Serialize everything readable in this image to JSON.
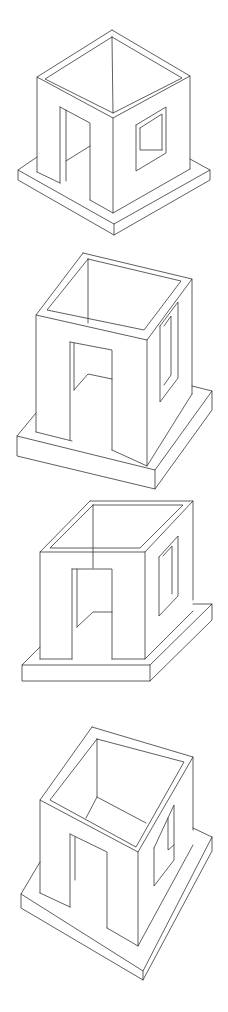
{
  "diagram": {
    "title": "",
    "stroke_color": "#2a2a2a",
    "background": "#ffffff",
    "figures": [
      {
        "id": "figure-1",
        "view": "isometric",
        "polylines": [
          [
            [
              112,
              30
            ],
            [
              190,
              76
            ],
            [
              113,
              118
            ],
            [
              37,
              77
            ],
            [
              112,
              30
            ]
          ],
          [
            [
              112,
              37
            ],
            [
              182,
              78
            ],
            [
              113,
              113
            ],
            [
              45,
              79
            ],
            [
              112,
              37
            ]
          ],
          [
            [
              112,
              37
            ],
            [
              113,
              113
            ]
          ],
          [
            [
              37,
              77
            ],
            [
              37,
              172
            ]
          ],
          [
            [
              113,
              118
            ],
            [
              113,
              213
            ]
          ],
          [
            [
              190,
              76
            ],
            [
              190,
              169
            ]
          ],
          [
            [
              37,
              157
            ],
            [
              18,
              170
            ],
            [
              114,
              224
            ],
            [
              210,
              170
            ],
            [
              190,
              159
            ]
          ],
          [
            [
              18,
              170
            ],
            [
              18,
              180
            ],
            [
              114,
              235
            ],
            [
              210,
              180
            ],
            [
              210,
              170
            ]
          ],
          [
            [
              114,
              224
            ],
            [
              114,
              235
            ]
          ],
          [
            [
              37,
              172
            ],
            [
              60,
              183
            ]
          ],
          [
            [
              90,
              200
            ],
            [
              113,
              213
            ],
            [
              190,
              169
            ]
          ],
          [
            [
              60,
              107
            ],
            [
              60,
              183
            ]
          ],
          [
            [
              66,
              110
            ],
            [
              66,
              181
            ]
          ],
          [
            [
              60,
              107
            ],
            [
              90,
              123
            ],
            [
              90,
              200
            ]
          ],
          [
            [
              66,
              161
            ],
            [
              90,
              146
            ]
          ],
          [
            [
              136,
              125
            ],
            [
              166,
              107
            ],
            [
              166,
              153
            ],
            [
              136,
              171
            ],
            [
              136,
              125
            ]
          ],
          [
            [
              140,
              128
            ],
            [
              162,
              114
            ],
            [
              162,
              150
            ]
          ],
          [
            [
              140,
              128
            ],
            [
              140,
              150
            ],
            [
              162,
              150
            ]
          ]
        ]
      },
      {
        "id": "figure-2",
        "view": "oblique-two-point",
        "polylines": [
          [
            [
              83,
              253
            ],
            [
              192,
              279
            ],
            [
              147,
              340
            ],
            [
              36,
              315
            ],
            [
              83,
              253
            ]
          ],
          [
            [
              88,
              259
            ],
            [
              181,
              281
            ],
            [
              144,
              330
            ],
            [
              47,
              310
            ],
            [
              88,
              259
            ]
          ],
          [
            [
              88,
              259
            ],
            [
              88,
              323
            ]
          ],
          [
            [
              36,
              315
            ],
            [
              36,
              432
            ]
          ],
          [
            [
              147,
              340
            ],
            [
              147,
              466
            ]
          ],
          [
            [
              192,
              279
            ],
            [
              192,
              394
            ]
          ],
          [
            [
              36,
              413
            ],
            [
              17,
              436
            ],
            [
              155,
              470
            ],
            [
              212,
              391
            ],
            [
              192,
              386
            ]
          ],
          [
            [
              17,
              436
            ],
            [
              17,
              456
            ],
            [
              155,
              489
            ],
            [
              212,
              410
            ],
            [
              212,
              391
            ]
          ],
          [
            [
              155,
              470
            ],
            [
              155,
              489
            ]
          ],
          [
            [
              36,
              432
            ],
            [
              72,
              441
            ]
          ],
          [
            [
              112,
              450
            ],
            [
              147,
              466
            ],
            [
              192,
              394
            ]
          ],
          [
            [
              70,
              342
            ],
            [
              70,
              440
            ]
          ],
          [
            [
              74,
              343
            ],
            [
              74,
              390
            ]
          ],
          [
            [
              70,
              342
            ],
            [
              112,
              350
            ],
            [
              112,
              450
            ]
          ],
          [
            [
              74,
              390
            ],
            [
              88,
              374
            ],
            [
              112,
              379
            ]
          ],
          [
            [
              160,
              326
            ],
            [
              178,
              302
            ],
            [
              178,
              378
            ],
            [
              160,
              402
            ],
            [
              160,
              326
            ]
          ],
          [
            [
              164,
              326
            ],
            [
              171,
              316
            ],
            [
              171,
              375
            ],
            [
              164,
              385
            ]
          ]
        ]
      },
      {
        "id": "figure-3",
        "view": "oblique-cabinet",
        "polylines": [
          [
            [
              90,
              501
            ],
            [
              193,
              501
            ],
            [
              145,
              552
            ],
            [
              40,
              552
            ],
            [
              90,
              501
            ]
          ],
          [
            [
              93,
              505
            ],
            [
              183,
              505
            ],
            [
              140,
              548
            ],
            [
              50,
              548
            ],
            [
              93,
              505
            ]
          ],
          [
            [
              93,
              505
            ],
            [
              93,
              568
            ]
          ],
          [
            [
              40,
              552
            ],
            [
              40,
              659
            ]
          ],
          [
            [
              145,
              552
            ],
            [
              145,
              659
            ]
          ],
          [
            [
              193,
              501
            ],
            [
              193,
              600
            ]
          ],
          [
            [
              40,
              647
            ],
            [
              22,
              665
            ],
            [
              150,
              665
            ],
            [
              212,
              604
            ],
            [
              193,
              604
            ]
          ],
          [
            [
              22,
              665
            ],
            [
              22,
              681
            ],
            [
              150,
              681
            ],
            [
              212,
              620
            ],
            [
              212,
              604
            ]
          ],
          [
            [
              150,
              665
            ],
            [
              150,
              681
            ]
          ],
          [
            [
              40,
              659
            ],
            [
              72,
              659
            ]
          ],
          [
            [
              112,
              659
            ],
            [
              145,
              659
            ],
            [
              193,
              611
            ]
          ],
          [
            [
              72,
              569
            ],
            [
              72,
              659
            ]
          ],
          [
            [
              77,
              569
            ],
            [
              77,
              627
            ]
          ],
          [
            [
              72,
              569
            ],
            [
              112,
              569
            ],
            [
              112,
              659
            ]
          ],
          [
            [
              77,
              627
            ],
            [
              93,
              612
            ],
            [
              112,
              612
            ]
          ],
          [
            [
              159,
              557
            ],
            [
              178,
              536
            ],
            [
              178,
              596
            ],
            [
              159,
              616
            ],
            [
              159,
              557
            ]
          ],
          [
            [
              163,
              556
            ],
            [
              172,
              546
            ],
            [
              172,
              594
            ]
          ]
        ]
      },
      {
        "id": "figure-4",
        "view": "planometric",
        "polylines": [
          [
            [
              92,
              727
            ],
            [
              193,
              757
            ],
            [
              138,
              852
            ],
            [
              40,
              800
            ],
            [
              92,
              727
            ]
          ],
          [
            [
              97,
              739
            ],
            [
              184,
              762
            ],
            [
              136,
              847
            ],
            [
              50,
              800
            ],
            [
              97,
              739
            ]
          ],
          [
            [
              97,
              739
            ],
            [
              97,
              797
            ],
            [
              86,
              818
            ]
          ],
          [
            [
              97,
              797
            ],
            [
              146,
              823
            ]
          ],
          [
            [
              40,
              800
            ],
            [
              40,
              893
            ]
          ],
          [
            [
              138,
              852
            ],
            [
              138,
              946
            ]
          ],
          [
            [
              193,
              757
            ],
            [
              193,
              830
            ]
          ],
          [
            [
              40,
              862
            ],
            [
              21,
              894
            ],
            [
              143,
              971
            ],
            [
              212,
              837
            ],
            [
              193,
              828
            ]
          ],
          [
            [
              21,
              894
            ],
            [
              21,
              908
            ],
            [
              143,
              980
            ],
            [
              212,
              851
            ],
            [
              212,
              837
            ]
          ],
          [
            [
              143,
              971
            ],
            [
              143,
              980
            ]
          ],
          [
            [
              40,
              893
            ],
            [
              70,
              907
            ]
          ],
          [
            [
              107,
              928
            ],
            [
              138,
              946
            ],
            [
              193,
              845
            ]
          ],
          [
            [
              70,
              834
            ],
            [
              70,
              907
            ]
          ],
          [
            [
              75,
              837
            ],
            [
              75,
              880
            ]
          ],
          [
            [
              70,
              834
            ],
            [
              107,
              852
            ],
            [
              107,
              928
            ]
          ],
          [
            [
              154,
              848
            ],
            [
              174,
              805
            ],
            [
              174,
              860
            ],
            [
              154,
              886
            ],
            [
              154,
              848
            ]
          ],
          [
            [
              168,
              818
            ],
            [
              168,
              850
            ],
            [
              174,
              845
            ]
          ]
        ]
      }
    ]
  }
}
